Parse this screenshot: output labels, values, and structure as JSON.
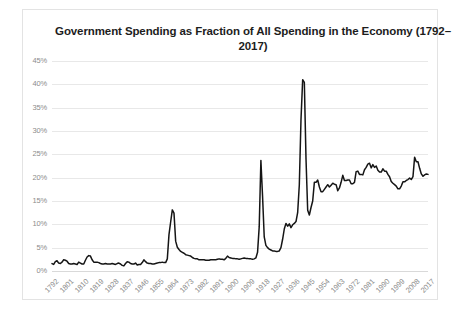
{
  "chart_data": {
    "type": "line",
    "title": "Government Spending as Fraction of All Spending in the Economy (1792–2017)",
    "xlabel": "",
    "ylabel": "",
    "ylim": [
      0,
      45
    ],
    "ytick_labels": [
      "45%",
      "40%",
      "35%",
      "30%",
      "25%",
      "20%",
      "15%",
      "10%",
      "5%",
      "0%"
    ],
    "ytick_values": [
      45,
      40,
      35,
      30,
      25,
      20,
      15,
      10,
      5,
      0
    ],
    "xlim": [
      1792,
      2017
    ],
    "xtick_labels": [
      "1792",
      "1801",
      "1810",
      "1819",
      "1828",
      "1837",
      "1846",
      "1855",
      "1864",
      "1873",
      "1882",
      "1891",
      "1900",
      "1909",
      "1918",
      "1927",
      "1936",
      "1945",
      "1954",
      "1963",
      "1972",
      "1981",
      "1990",
      "1999",
      "2008",
      "2017"
    ],
    "xtick_values": [
      1792,
      1801,
      1810,
      1819,
      1828,
      1837,
      1846,
      1855,
      1864,
      1873,
      1882,
      1891,
      1900,
      1909,
      1918,
      1927,
      1936,
      1945,
      1954,
      1963,
      1972,
      1981,
      1990,
      1999,
      2008,
      2017
    ],
    "grid": "horizontal",
    "legend": "none",
    "line_color": "#151515",
    "series": [
      {
        "name": "Government Spending as Fraction of All Spending",
        "x": [
          1792,
          1793,
          1794,
          1795,
          1796,
          1797,
          1798,
          1799,
          1800,
          1801,
          1802,
          1803,
          1804,
          1805,
          1806,
          1807,
          1808,
          1809,
          1810,
          1811,
          1812,
          1813,
          1814,
          1815,
          1816,
          1817,
          1818,
          1819,
          1820,
          1821,
          1822,
          1823,
          1824,
          1825,
          1826,
          1827,
          1828,
          1829,
          1830,
          1831,
          1832,
          1833,
          1834,
          1835,
          1836,
          1837,
          1838,
          1839,
          1840,
          1841,
          1842,
          1843,
          1844,
          1845,
          1846,
          1847,
          1848,
          1849,
          1850,
          1851,
          1852,
          1853,
          1854,
          1855,
          1856,
          1857,
          1858,
          1859,
          1860,
          1861,
          1862,
          1863,
          1864,
          1865,
          1866,
          1867,
          1868,
          1869,
          1870,
          1871,
          1872,
          1873,
          1874,
          1875,
          1876,
          1877,
          1878,
          1879,
          1880,
          1881,
          1882,
          1883,
          1884,
          1885,
          1886,
          1887,
          1888,
          1889,
          1890,
          1891,
          1892,
          1893,
          1894,
          1895,
          1896,
          1897,
          1898,
          1899,
          1900,
          1901,
          1902,
          1903,
          1904,
          1905,
          1906,
          1907,
          1908,
          1909,
          1910,
          1911,
          1912,
          1913,
          1914,
          1915,
          1916,
          1917,
          1918,
          1919,
          1920,
          1921,
          1922,
          1923,
          1924,
          1925,
          1926,
          1927,
          1928,
          1929,
          1930,
          1931,
          1932,
          1933,
          1934,
          1935,
          1936,
          1937,
          1938,
          1939,
          1940,
          1941,
          1942,
          1943,
          1944,
          1945,
          1946,
          1947,
          1948,
          1949,
          1950,
          1951,
          1952,
          1953,
          1954,
          1955,
          1956,
          1957,
          1958,
          1959,
          1960,
          1961,
          1962,
          1963,
          1964,
          1965,
          1966,
          1967,
          1968,
          1969,
          1970,
          1971,
          1972,
          1973,
          1974,
          1975,
          1976,
          1977,
          1978,
          1979,
          1980,
          1981,
          1982,
          1983,
          1984,
          1985,
          1986,
          1987,
          1988,
          1989,
          1990,
          1991,
          1992,
          1993,
          1994,
          1995,
          1996,
          1997,
          1998,
          1999,
          2000,
          2001,
          2002,
          2003,
          2004,
          2005,
          2006,
          2007,
          2008,
          2009,
          2010,
          2011,
          2012,
          2013,
          2014,
          2015,
          2016,
          2017
        ],
        "values": [
          1.6,
          1.4,
          2.0,
          2.2,
          1.7,
          1.6,
          1.9,
          2.4,
          2.3,
          2.1,
          1.6,
          1.5,
          1.5,
          1.6,
          1.5,
          1.4,
          1.9,
          1.7,
          1.5,
          1.5,
          2.3,
          3.0,
          3.3,
          3.2,
          2.4,
          1.9,
          1.9,
          1.9,
          1.8,
          1.6,
          1.5,
          1.5,
          1.6,
          1.5,
          1.5,
          1.5,
          1.6,
          1.5,
          1.4,
          1.6,
          1.7,
          1.5,
          1.2,
          1.1,
          1.6,
          2.0,
          1.9,
          1.6,
          1.5,
          1.5,
          1.7,
          1.3,
          1.4,
          1.4,
          1.8,
          2.4,
          2.0,
          1.7,
          1.6,
          1.6,
          1.5,
          1.5,
          1.6,
          1.7,
          1.8,
          1.8,
          1.9,
          1.8,
          1.8,
          2.6,
          7.8,
          10.5,
          13.1,
          12.4,
          6.4,
          5.1,
          4.6,
          4.2,
          4.0,
          3.8,
          3.5,
          3.4,
          3.3,
          3.2,
          2.9,
          2.7,
          2.6,
          2.6,
          2.4,
          2.4,
          2.4,
          2.4,
          2.3,
          2.3,
          2.3,
          2.4,
          2.4,
          2.4,
          2.4,
          2.5,
          2.6,
          2.5,
          2.5,
          2.4,
          2.7,
          3.2,
          2.9,
          2.8,
          2.7,
          2.7,
          2.6,
          2.6,
          2.5,
          2.6,
          2.7,
          2.8,
          2.7,
          2.7,
          2.6,
          2.6,
          2.5,
          2.6,
          2.8,
          4.0,
          9.5,
          23.7,
          16.0,
          7.3,
          5.5,
          5.0,
          4.7,
          4.5,
          4.3,
          4.3,
          4.2,
          4.2,
          4.3,
          5.0,
          6.8,
          9.0,
          10.2,
          9.6,
          10.1,
          9.3,
          9.9,
          10.2,
          10.6,
          12.5,
          18.5,
          32.5,
          41.0,
          40.4,
          24.0,
          13.0,
          12.0,
          13.6,
          15.0,
          19.0,
          19.0,
          19.5,
          18.0,
          17.0,
          17.0,
          17.5,
          18.0,
          18.5,
          18.0,
          18.4,
          18.8,
          18.6,
          18.5,
          17.2,
          17.8,
          19.0,
          20.5,
          19.4,
          19.4,
          19.5,
          19.5,
          18.7,
          18.7,
          19.0,
          21.3,
          21.4,
          20.7,
          20.7,
          20.6,
          21.7,
          22.2,
          22.9,
          23.1,
          22.1,
          22.8,
          22.2,
          22.5,
          21.6,
          21.2,
          21.2,
          21.9,
          21.4,
          21.4,
          20.7,
          20.2,
          19.2,
          18.8,
          18.5,
          18.2,
          17.6,
          17.6,
          18.2,
          19.1,
          19.1,
          19.4,
          19.6,
          19.9,
          19.6,
          20.2,
          24.4,
          23.4,
          23.4,
          22.0,
          20.8,
          20.3,
          20.6,
          20.8,
          20.7
        ]
      }
    ]
  }
}
